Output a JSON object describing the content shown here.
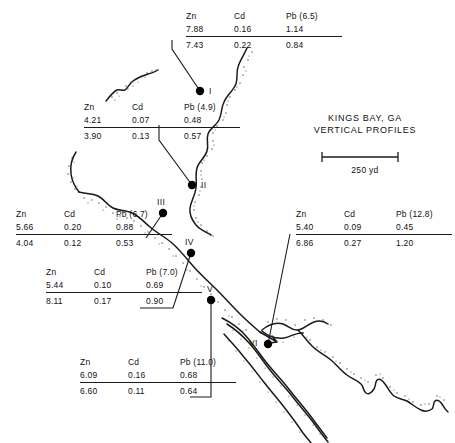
{
  "map": {
    "title_line1": "KINGS BAY, GA",
    "title_line2": "VERTICAL PROFILES",
    "scale_label": "250 yd",
    "columns": [
      "Zn",
      "Cd",
      "Pb"
    ],
    "colors": {
      "ink": "#111111",
      "shoreline": "#1a1a1a",
      "stipple": "#555555",
      "marker": "#000000"
    }
  },
  "stations": [
    {
      "id": "I",
      "marker_label": "I",
      "headers": {
        "zn": "Zn",
        "cd": "Cd",
        "pb": "Pb (6.5)"
      },
      "upper": {
        "zn": "7.88",
        "cd": "0.16",
        "pb": "1.14"
      },
      "lower": {
        "zn": "7.43",
        "cd": "0.22",
        "pb": "0.84"
      }
    },
    {
      "id": "II",
      "marker_label": "II",
      "headers": {
        "zn": "Zn",
        "cd": "Cd",
        "pb": "Pb (4.9)"
      },
      "upper": {
        "zn": "4.21",
        "cd": "0.07",
        "pb": "0.48"
      },
      "lower": {
        "zn": "3.90",
        "cd": "0.13",
        "pb": "0.57"
      }
    },
    {
      "id": "III",
      "marker_label": "III",
      "headers": {
        "zn": "Zn",
        "cd": "Cd",
        "pb": "Pb (6.7)"
      },
      "upper": {
        "zn": "5.66",
        "cd": "0.20",
        "pb": "0.88"
      },
      "lower": {
        "zn": "4.04",
        "cd": "0.12",
        "pb": "0.53"
      }
    },
    {
      "id": "IV",
      "marker_label": "IV",
      "headers": {
        "zn": "Zn",
        "cd": "Cd",
        "pb": "Pb (7.0)"
      },
      "upper": {
        "zn": "5.44",
        "cd": "0.10",
        "pb": "0.69"
      },
      "lower": {
        "zn": "8.11",
        "cd": "0.17",
        "pb": "0.90"
      }
    },
    {
      "id": "V",
      "marker_label": "V",
      "headers": {
        "zn": "Zn",
        "cd": "Cd",
        "pb": "Pb (11.0)"
      },
      "upper": {
        "zn": "6.09",
        "cd": "0.16",
        "pb": "0.68"
      },
      "lower": {
        "zn": "6.60",
        "cd": "0.11",
        "pb": "0.64"
      }
    },
    {
      "id": "VI",
      "marker_label": "VI",
      "headers": {
        "zn": "Zn",
        "cd": "Cd",
        "pb": "Pb (12.8)"
      },
      "upper": {
        "zn": "5.40",
        "cd": "0.09",
        "pb": "0.45"
      },
      "lower": {
        "zn": "6.86",
        "cd": "0.27",
        "pb": "1.20"
      }
    }
  ]
}
